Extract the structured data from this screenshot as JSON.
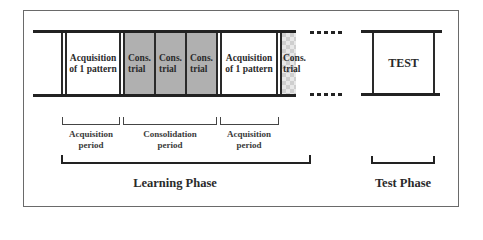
{
  "diagram": {
    "cells": [
      {
        "label_line1": "Acquisition",
        "label_line2": "of 1 pattern",
        "fill": "white"
      },
      {
        "label_line1": "Cons.",
        "label_line2": "trial",
        "fill": "gray"
      },
      {
        "label_line1": "Cons.",
        "label_line2": "trial",
        "fill": "gray"
      },
      {
        "label_line1": "Cons.",
        "label_line2": "trial",
        "fill": "gray"
      },
      {
        "label_line1": "Acquisition",
        "label_line2": "of 1 pattern",
        "fill": "white"
      },
      {
        "label_line1": "Cons.",
        "label_line2": "trial",
        "fill": "checkered"
      }
    ],
    "test_box": {
      "label": "TEST"
    },
    "periods": [
      {
        "line1": "Acquisition",
        "line2": "period"
      },
      {
        "line1": "Consolidation",
        "line2": "period"
      },
      {
        "line1": "Acquisition",
        "line2": "period"
      }
    ],
    "phases": {
      "learning": "Learning Phase",
      "test": "Test Phase"
    },
    "colors": {
      "gray_fill": "#b0b0b0",
      "line": "#222222",
      "frame": "#6a6a6a"
    }
  }
}
